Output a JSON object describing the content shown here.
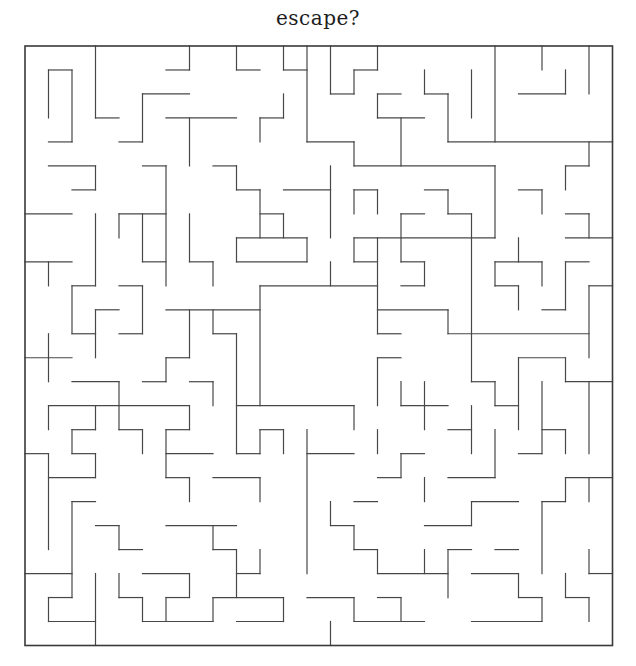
{
  "page": {
    "title": "escape?",
    "background": "#ffffff",
    "width": 636,
    "height": 666
  },
  "maze": {
    "grid": {
      "cols": 25,
      "rows": 25,
      "origin_x": 25,
      "origin_y": 46,
      "cell_w": 23.5,
      "cell_h": 23.98
    },
    "style": {
      "wall_color": "#474747",
      "border_color": "#3a3a3a",
      "wall_width": 1.2,
      "border_width": 1.6,
      "background": "#ffffff"
    },
    "border": {
      "closed": true,
      "openings": []
    },
    "center_room": {
      "col_start": 10,
      "col_end": 15,
      "row_start": 10,
      "row_end": 15,
      "doors": [
        {
          "side": "right",
          "row_start": 12,
          "row_end": 13
        },
        {
          "side": "bottom",
          "col_start": 14,
          "col_end": 15
        }
      ]
    },
    "h_walls": [
      [
        1,
        1,
        2
      ],
      [
        1,
        6,
        7
      ],
      [
        1,
        9,
        10
      ],
      [
        1,
        11,
        12
      ],
      [
        1,
        14,
        15
      ],
      [
        2,
        5,
        7
      ],
      [
        2,
        13,
        14
      ],
      [
        2,
        15,
        16
      ],
      [
        2,
        17,
        18
      ],
      [
        2,
        21,
        23
      ],
      [
        3,
        3,
        4
      ],
      [
        3,
        6,
        9
      ],
      [
        3,
        10,
        11
      ],
      [
        3,
        15,
        17
      ],
      [
        4,
        1,
        2
      ],
      [
        4,
        4,
        5
      ],
      [
        4,
        12,
        14
      ],
      [
        4,
        18,
        25
      ],
      [
        5,
        1,
        3
      ],
      [
        5,
        5,
        6
      ],
      [
        5,
        8,
        9
      ],
      [
        5,
        14,
        20
      ],
      [
        5,
        23,
        24
      ],
      [
        6,
        2,
        3
      ],
      [
        6,
        9,
        10
      ],
      [
        6,
        11,
        13
      ],
      [
        6,
        14,
        15
      ],
      [
        6,
        17,
        18
      ],
      [
        6,
        21,
        22
      ],
      [
        7,
        0,
        2
      ],
      [
        7,
        4,
        6
      ],
      [
        7,
        10,
        11
      ],
      [
        7,
        16,
        17
      ],
      [
        7,
        18,
        19
      ],
      [
        7,
        23,
        24
      ],
      [
        8,
        9,
        12
      ],
      [
        8,
        14,
        20
      ],
      [
        8,
        23,
        25
      ],
      [
        9,
        0,
        2
      ],
      [
        9,
        5,
        6
      ],
      [
        9,
        7,
        8
      ],
      [
        9,
        9,
        12
      ],
      [
        9,
        14,
        15
      ],
      [
        9,
        16,
        17
      ],
      [
        9,
        20,
        22
      ],
      [
        9,
        23,
        24
      ],
      [
        10,
        2,
        3
      ],
      [
        10,
        4,
        5
      ],
      [
        10,
        10,
        15
      ],
      [
        10,
        16,
        17
      ],
      [
        10,
        20,
        21
      ],
      [
        10,
        24,
        25
      ],
      [
        11,
        3,
        4
      ],
      [
        11,
        6,
        10
      ],
      [
        11,
        15,
        18
      ],
      [
        11,
        22,
        23
      ],
      [
        12,
        2,
        3
      ],
      [
        12,
        4,
        5
      ],
      [
        12,
        8,
        9
      ],
      [
        12,
        15,
        16
      ],
      [
        12,
        18,
        24
      ],
      [
        13,
        0,
        2
      ],
      [
        13,
        6,
        7
      ],
      [
        13,
        15,
        16
      ],
      [
        13,
        21,
        23
      ],
      [
        14,
        2,
        4
      ],
      [
        14,
        5,
        6
      ],
      [
        14,
        7,
        8
      ],
      [
        14,
        19,
        20
      ],
      [
        14,
        23,
        25
      ],
      [
        15,
        1,
        7
      ],
      [
        15,
        9,
        14
      ],
      [
        15,
        16,
        18
      ],
      [
        15,
        20,
        21
      ],
      [
        16,
        2,
        3
      ],
      [
        16,
        4,
        5
      ],
      [
        16,
        6,
        7
      ],
      [
        16,
        10,
        11
      ],
      [
        16,
        18,
        19
      ],
      [
        16,
        22,
        23
      ],
      [
        17,
        0,
        1
      ],
      [
        17,
        2,
        3
      ],
      [
        17,
        6,
        8
      ],
      [
        17,
        9,
        10
      ],
      [
        17,
        12,
        14
      ],
      [
        17,
        16,
        17
      ],
      [
        17,
        21,
        22
      ],
      [
        18,
        1,
        3
      ],
      [
        18,
        6,
        7
      ],
      [
        18,
        8,
        10
      ],
      [
        18,
        15,
        16
      ],
      [
        18,
        18,
        20
      ],
      [
        18,
        23,
        25
      ],
      [
        19,
        2,
        3
      ],
      [
        19,
        14,
        15
      ],
      [
        19,
        19,
        21
      ],
      [
        19,
        22,
        23
      ],
      [
        20,
        3,
        4
      ],
      [
        20,
        6,
        9
      ],
      [
        20,
        13,
        14
      ],
      [
        20,
        17,
        19
      ],
      [
        21,
        4,
        5
      ],
      [
        21,
        8,
        9
      ],
      [
        21,
        14,
        15
      ],
      [
        21,
        18,
        19
      ],
      [
        21,
        20,
        21
      ],
      [
        22,
        0,
        2
      ],
      [
        22,
        5,
        7
      ],
      [
        22,
        9,
        10
      ],
      [
        22,
        15,
        18
      ],
      [
        22,
        19,
        21
      ],
      [
        22,
        24,
        25
      ],
      [
        23,
        1,
        2
      ],
      [
        23,
        4,
        5
      ],
      [
        23,
        6,
        7
      ],
      [
        23,
        8,
        11
      ],
      [
        23,
        12,
        14
      ],
      [
        23,
        15,
        16
      ],
      [
        23,
        21,
        22
      ],
      [
        23,
        23,
        24
      ],
      [
        24,
        1,
        3
      ],
      [
        24,
        5,
        8
      ],
      [
        24,
        9,
        11
      ],
      [
        24,
        14,
        17
      ],
      [
        24,
        19,
        22
      ]
    ],
    "v_walls": [
      [
        1,
        1,
        3
      ],
      [
        1,
        9,
        10
      ],
      [
        1,
        12,
        14
      ],
      [
        1,
        15,
        16
      ],
      [
        1,
        17,
        21
      ],
      [
        1,
        23,
        24
      ],
      [
        2,
        1,
        4
      ],
      [
        2,
        10,
        12
      ],
      [
        2,
        16,
        17
      ],
      [
        2,
        19,
        23
      ],
      [
        3,
        0,
        3
      ],
      [
        3,
        5,
        6
      ],
      [
        3,
        7,
        10
      ],
      [
        3,
        11,
        13
      ],
      [
        3,
        15,
        16
      ],
      [
        3,
        17,
        18
      ],
      [
        3,
        22,
        25
      ],
      [
        4,
        7,
        8
      ],
      [
        4,
        14,
        16
      ],
      [
        4,
        20,
        21
      ],
      [
        4,
        22,
        23
      ],
      [
        5,
        2,
        4
      ],
      [
        5,
        7,
        9
      ],
      [
        5,
        10,
        12
      ],
      [
        5,
        16,
        17
      ],
      [
        5,
        23,
        24
      ],
      [
        6,
        5,
        10
      ],
      [
        6,
        13,
        14
      ],
      [
        6,
        16,
        18
      ],
      [
        6,
        23,
        24
      ],
      [
        7,
        0,
        1
      ],
      [
        7,
        3,
        5
      ],
      [
        7,
        7,
        9
      ],
      [
        7,
        11,
        13
      ],
      [
        7,
        15,
        16
      ],
      [
        7,
        18,
        19
      ],
      [
        7,
        22,
        23
      ],
      [
        8,
        9,
        10
      ],
      [
        8,
        11,
        12
      ],
      [
        8,
        14,
        15
      ],
      [
        8,
        20,
        21
      ],
      [
        8,
        23,
        24
      ],
      [
        9,
        0,
        1
      ],
      [
        9,
        5,
        6
      ],
      [
        9,
        8,
        9
      ],
      [
        9,
        12,
        17
      ],
      [
        9,
        21,
        23
      ],
      [
        10,
        3,
        4
      ],
      [
        10,
        6,
        8
      ],
      [
        10,
        10,
        15
      ],
      [
        10,
        16,
        17
      ],
      [
        10,
        18,
        19
      ],
      [
        10,
        21,
        22
      ],
      [
        11,
        0,
        1
      ],
      [
        11,
        2,
        3
      ],
      [
        11,
        7,
        8
      ],
      [
        11,
        16,
        17
      ],
      [
        11,
        23,
        24
      ],
      [
        12,
        0,
        4
      ],
      [
        12,
        8,
        9
      ],
      [
        12,
        16,
        22
      ],
      [
        13,
        0,
        2
      ],
      [
        13,
        5,
        8
      ],
      [
        13,
        9,
        10
      ],
      [
        13,
        19,
        20
      ],
      [
        13,
        24,
        25
      ],
      [
        14,
        1,
        2
      ],
      [
        14,
        4,
        5
      ],
      [
        14,
        6,
        7
      ],
      [
        14,
        8,
        9
      ],
      [
        14,
        15,
        16
      ],
      [
        14,
        20,
        21
      ],
      [
        14,
        23,
        24
      ],
      [
        15,
        0,
        1
      ],
      [
        15,
        2,
        3
      ],
      [
        15,
        6,
        7
      ],
      [
        15,
        8,
        12
      ],
      [
        15,
        13,
        15
      ],
      [
        15,
        16,
        17
      ],
      [
        15,
        21,
        22
      ],
      [
        16,
        3,
        5
      ],
      [
        16,
        7,
        9
      ],
      [
        16,
        14,
        15
      ],
      [
        16,
        17,
        18
      ],
      [
        16,
        23,
        24
      ],
      [
        17,
        1,
        2
      ],
      [
        17,
        9,
        10
      ],
      [
        17,
        14,
        16
      ],
      [
        17,
        18,
        19
      ],
      [
        17,
        21,
        22
      ],
      [
        18,
        2,
        4
      ],
      [
        18,
        6,
        7
      ],
      [
        18,
        11,
        12
      ],
      [
        18,
        21,
        23
      ],
      [
        19,
        1,
        3
      ],
      [
        19,
        7,
        14
      ],
      [
        19,
        15,
        17
      ],
      [
        19,
        19,
        20
      ],
      [
        20,
        0,
        4
      ],
      [
        20,
        5,
        8
      ],
      [
        20,
        9,
        10
      ],
      [
        20,
        14,
        15
      ],
      [
        20,
        16,
        18
      ],
      [
        21,
        8,
        9
      ],
      [
        21,
        10,
        11
      ],
      [
        21,
        13,
        16
      ],
      [
        21,
        22,
        23
      ],
      [
        22,
        0,
        1
      ],
      [
        22,
        6,
        7
      ],
      [
        22,
        9,
        10
      ],
      [
        22,
        14,
        17
      ],
      [
        22,
        19,
        22
      ],
      [
        22,
        23,
        24
      ],
      [
        23,
        1,
        2
      ],
      [
        23,
        5,
        6
      ],
      [
        23,
        9,
        11
      ],
      [
        23,
        13,
        14
      ],
      [
        23,
        16,
        17
      ],
      [
        23,
        18,
        19
      ],
      [
        23,
        22,
        23
      ],
      [
        24,
        0,
        2
      ],
      [
        24,
        4,
        5
      ],
      [
        24,
        7,
        8
      ],
      [
        24,
        10,
        13
      ],
      [
        24,
        14,
        17
      ],
      [
        24,
        18,
        19
      ],
      [
        24,
        21,
        22
      ],
      [
        24,
        23,
        24
      ]
    ]
  }
}
